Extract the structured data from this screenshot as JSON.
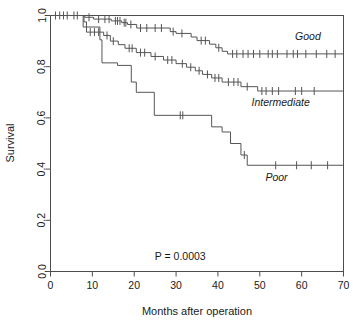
{
  "chart_data": {
    "type": "line",
    "chart_kind": "kaplan-meier-survival",
    "title": "",
    "xlabel": "Months after operation",
    "ylabel": "Survival",
    "xlim": [
      0,
      70
    ],
    "ylim": [
      0.0,
      1.0
    ],
    "xticks": [
      0,
      10,
      20,
      30,
      40,
      50,
      60,
      70
    ],
    "xtick_labels": [
      "0",
      "10",
      "20",
      "30",
      "40",
      "50",
      "60",
      "70"
    ],
    "yticks": [
      0.0,
      0.2,
      0.4,
      0.6,
      0.8,
      1.0
    ],
    "ytick_labels": [
      "0.0",
      "0.2",
      "0.4",
      "0.6",
      "0.8",
      "1.0"
    ],
    "grid": false,
    "legend_position": "inline-end-of-curve",
    "annotations": [
      {
        "text": "P = 0.0003",
        "x": 31.0,
        "y": 0.045
      }
    ],
    "series": [
      {
        "name": "Good",
        "label": "Good",
        "label_x": 61.5,
        "label_y": 0.905,
        "color": "#555555",
        "steps": [
          [
            0,
            1.0
          ],
          [
            8.2,
            1.0
          ],
          [
            8.2,
            0.993
          ],
          [
            10.3,
            0.993
          ],
          [
            10.3,
            0.986
          ],
          [
            14.5,
            0.986
          ],
          [
            14.5,
            0.979
          ],
          [
            17.0,
            0.979
          ],
          [
            17.0,
            0.972
          ],
          [
            18.4,
            0.972
          ],
          [
            18.4,
            0.965
          ],
          [
            20.6,
            0.965
          ],
          [
            20.6,
            0.951
          ],
          [
            28.6,
            0.951
          ],
          [
            28.6,
            0.937
          ],
          [
            30.0,
            0.937
          ],
          [
            30.0,
            0.93
          ],
          [
            33.6,
            0.93
          ],
          [
            33.6,
            0.916
          ],
          [
            35.0,
            0.916
          ],
          [
            35.0,
            0.902
          ],
          [
            38.0,
            0.902
          ],
          [
            38.0,
            0.888
          ],
          [
            39.5,
            0.888
          ],
          [
            39.5,
            0.874
          ],
          [
            41.0,
            0.874
          ],
          [
            41.0,
            0.86
          ],
          [
            42.3,
            0.86
          ],
          [
            42.3,
            0.85
          ],
          [
            70,
            0.85
          ]
        ],
        "censor_times": [
          1.2,
          2.2,
          3.1,
          4.0,
          5.6,
          6.4,
          9.2,
          11.5,
          13.0,
          14.0,
          15.5,
          16.0,
          16.6,
          17.6,
          18.0,
          19.2,
          21.5,
          23.0,
          25.0,
          26.5,
          29.3,
          31.4,
          36.0,
          37.0,
          40.2,
          43.5,
          44.5,
          46.0,
          47.2,
          48.5,
          50.0,
          52.0,
          53.0,
          54.2,
          56.5,
          58.0,
          59.0,
          61.0,
          63.5,
          66.0,
          68.0
        ],
        "final_survival": 0.85
      },
      {
        "name": "Intermediate",
        "label": "Intermediate",
        "label_x": 55.0,
        "label_y": 0.645,
        "color": "#555555",
        "steps": [
          [
            0,
            1.0
          ],
          [
            8.0,
            1.0
          ],
          [
            8.0,
            0.975
          ],
          [
            8.6,
            0.975
          ],
          [
            8.6,
            0.935
          ],
          [
            12.7,
            0.935
          ],
          [
            12.7,
            0.922
          ],
          [
            14.3,
            0.922
          ],
          [
            14.3,
            0.9
          ],
          [
            16.2,
            0.9
          ],
          [
            16.2,
            0.886
          ],
          [
            17.8,
            0.886
          ],
          [
            17.8,
            0.872
          ],
          [
            20.5,
            0.872
          ],
          [
            20.5,
            0.855
          ],
          [
            24.0,
            0.855
          ],
          [
            24.0,
            0.84
          ],
          [
            27.0,
            0.84
          ],
          [
            27.0,
            0.826
          ],
          [
            30.0,
            0.826
          ],
          [
            30.0,
            0.812
          ],
          [
            32.5,
            0.812
          ],
          [
            32.5,
            0.798
          ],
          [
            34.6,
            0.798
          ],
          [
            34.6,
            0.784
          ],
          [
            36.3,
            0.784
          ],
          [
            36.3,
            0.77
          ],
          [
            38.5,
            0.77
          ],
          [
            38.5,
            0.756
          ],
          [
            41.0,
            0.756
          ],
          [
            41.0,
            0.74
          ],
          [
            45.5,
            0.74
          ],
          [
            45.5,
            0.722
          ],
          [
            49.5,
            0.722
          ],
          [
            49.5,
            0.705
          ],
          [
            70,
            0.705
          ]
        ],
        "censor_times": [
          9.5,
          10.5,
          11.5,
          13.5,
          15.0,
          18.8,
          19.5,
          21.5,
          22.5,
          25.0,
          28.0,
          29.0,
          31.5,
          33.5,
          35.5,
          37.5,
          39.3,
          40.2,
          42.5,
          43.8,
          44.8,
          47.0,
          50.5,
          51.5,
          53.0,
          54.5,
          58.5,
          60.0,
          63.0
        ],
        "final_survival": 0.705
      },
      {
        "name": "Poor",
        "label": "Poor",
        "label_x": 54.0,
        "label_y": 0.355,
        "color": "#555555",
        "steps": [
          [
            0,
            1.0
          ],
          [
            7.8,
            1.0
          ],
          [
            7.8,
            0.955
          ],
          [
            11.8,
            0.955
          ],
          [
            11.8,
            0.905
          ],
          [
            12.3,
            0.905
          ],
          [
            12.3,
            0.815
          ],
          [
            16.0,
            0.815
          ],
          [
            16.0,
            0.805
          ],
          [
            19.3,
            0.805
          ],
          [
            19.3,
            0.74
          ],
          [
            20.5,
            0.74
          ],
          [
            20.5,
            0.7
          ],
          [
            24.8,
            0.7
          ],
          [
            24.8,
            0.61
          ],
          [
            38.5,
            0.61
          ],
          [
            38.5,
            0.565
          ],
          [
            41.0,
            0.565
          ],
          [
            41.0,
            0.545
          ],
          [
            43.0,
            0.545
          ],
          [
            43.0,
            0.5
          ],
          [
            45.5,
            0.5
          ],
          [
            45.5,
            0.455
          ],
          [
            47.0,
            0.455
          ],
          [
            47.0,
            0.415
          ],
          [
            70,
            0.415
          ]
        ],
        "censor_times": [
          31.0,
          31.6,
          46.3,
          53.8,
          58.8,
          62.3,
          66.2
        ],
        "final_survival": 0.415
      }
    ]
  },
  "figure": {
    "background_color": "#ffffff",
    "axis_color": "#4d4d4d",
    "curve_color": "#555555"
  }
}
